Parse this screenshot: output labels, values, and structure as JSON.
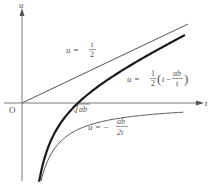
{
  "diagram": {
    "axes": {
      "x_label": "t",
      "y_label": "u",
      "origin_label": "O",
      "x_tick_label": "√ab"
    },
    "curves": [
      {
        "name": "line",
        "equation_text": "u = t/2",
        "lhs": "u =",
        "num": "t",
        "den": "2",
        "style": "thin"
      },
      {
        "name": "main",
        "equation_text": "u = 1/2 (t − ab/t)",
        "lhs": "u =",
        "coef_num": "1",
        "coef_den": "2",
        "paren_t": "t",
        "minus": "−",
        "inner_num": "ab",
        "inner_den": "t",
        "style": "thick"
      },
      {
        "name": "hyperbola",
        "equation_text": "u = −ab/(2t)",
        "lhs": "u = −",
        "num": "ab",
        "den": "2t",
        "style": "thin"
      }
    ],
    "colors": {
      "axis": "#7a7a7a",
      "thin_curve": "#555555",
      "thick_curve": "#1a1a1a",
      "text": "#555555"
    }
  }
}
